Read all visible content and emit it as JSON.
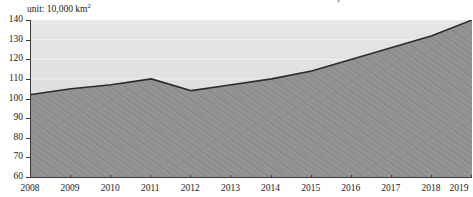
{
  "header": {
    "clipped_title": "Improved Grassland Areas",
    "unit_label_prefix": "unit: 10,000 km",
    "unit_label_exponent": "2"
  },
  "chart_data": {
    "type": "area",
    "title": "Improved Grassland Areas",
    "xlabel": "",
    "ylabel": "",
    "unit": "10,000 km2",
    "categories": [
      "2008",
      "2009",
      "2010",
      "2011",
      "2012",
      "2013",
      "2014",
      "2015",
      "2016",
      "2017",
      "2018",
      "2019"
    ],
    "x": [
      2008,
      2009,
      2010,
      2011,
      2012,
      2013,
      2014,
      2015,
      2016,
      2017,
      2018,
      2019
    ],
    "values": [
      102,
      105,
      107,
      110,
      104,
      107,
      110,
      114,
      120,
      126,
      132,
      140
    ],
    "series": [
      {
        "name": "Improved Grassland Areas",
        "values": [
          102,
          105,
          107,
          110,
          104,
          107,
          110,
          114,
          120,
          126,
          132,
          140
        ]
      }
    ],
    "ylim": [
      60,
      140
    ],
    "yticks": [
      60,
      70,
      80,
      90,
      100,
      110,
      120,
      130,
      140
    ],
    "ytick_labels": [
      "60",
      "70",
      "80",
      "90",
      "100",
      "110",
      "120",
      "130",
      "140"
    ],
    "xticks": [
      2008,
      2009,
      2010,
      2011,
      2012,
      2013,
      2014,
      2015,
      2016,
      2017,
      2018,
      2019
    ],
    "xtick_labels": [
      "2008",
      "2009",
      "2010",
      "2011",
      "2012",
      "2013",
      "2014",
      "2015",
      "2016",
      "2017",
      "2018",
      "2019"
    ],
    "grid": true,
    "grid_axis": "y",
    "legend": false,
    "legend_position": "none",
    "colors": {
      "line": "#2b2b2b",
      "fill_below": "#8f8f8f",
      "fill_above": "#dedede",
      "gridline": "#f2f2f2",
      "axis": "#3a3a3a",
      "text": "#1a1a1a"
    }
  }
}
